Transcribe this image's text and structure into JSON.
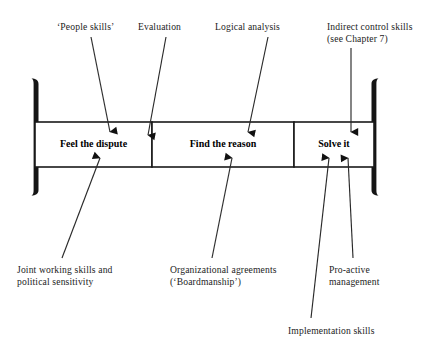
{
  "diagram": {
    "stroke_color": "#1a1a1a",
    "text_color": "#1c1c1c",
    "background": "#ffffff"
  },
  "bar": {
    "segments": [
      {
        "id": "feel",
        "label": "Feel the dispute"
      },
      {
        "id": "find",
        "label": "Find the reason"
      },
      {
        "id": "solve",
        "label": "Solve it"
      }
    ],
    "left_bracket": "[",
    "right_bracket": "]"
  },
  "annotations_top": [
    {
      "id": "people-skills",
      "label": "‘People skills’"
    },
    {
      "id": "evaluation",
      "label": "Evaluation"
    },
    {
      "id": "logical-analysis",
      "label": "Logical analysis"
    },
    {
      "id": "indirect-control",
      "line1": "Indirect control skills",
      "line2": "(see Chapter 7)"
    }
  ],
  "annotations_bottom": [
    {
      "id": "joint-working",
      "line1": "Joint working skills and",
      "line2": "political sensitivity"
    },
    {
      "id": "organizational-agreements",
      "line1": "Organizational agreements",
      "line2": "(‘Boardmanship’)"
    },
    {
      "id": "pro-active",
      "line1": "Pro-active",
      "line2": "management"
    },
    {
      "id": "implementation",
      "line1": "Implementation skills",
      "line2": ""
    }
  ]
}
